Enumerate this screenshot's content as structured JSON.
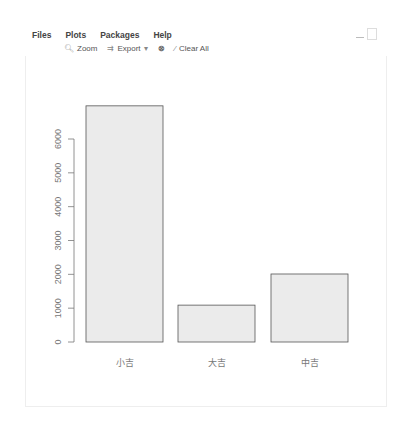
{
  "menu": {
    "tabs": [
      "Files",
      "Plots",
      "Packages",
      "Help"
    ]
  },
  "toolbar": {
    "zoom_label": "Zoom",
    "export_label": "Export",
    "clear_label": "Clear All",
    "icons": {
      "zoom": "magnifier-icon",
      "export": "export-icon",
      "remove": "remove-plot-icon",
      "clear": "broom-icon"
    }
  },
  "chart_data": {
    "type": "bar",
    "categories": [
      "小吉",
      "大吉",
      "中吉"
    ],
    "values": [
      6980,
      1090,
      2010
    ],
    "title": "",
    "xlabel": "",
    "ylabel": "",
    "ylim": [
      0,
      7000
    ],
    "yticks": [
      0,
      1000,
      2000,
      3000,
      4000,
      5000,
      6000
    ],
    "bar_fill": "#ebebeb",
    "bar_border": "#555555",
    "grid": false,
    "legend": null
  }
}
